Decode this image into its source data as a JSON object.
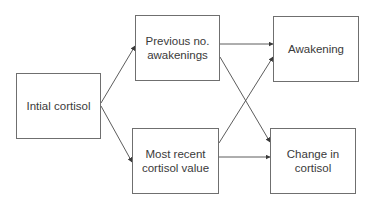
{
  "diagram": {
    "type": "flow-diagram",
    "line_color": "#4a4a4a",
    "nodes": [
      {
        "id": "initial",
        "label": "Intial cortisol",
        "x": 16,
        "y": 73,
        "w": 85,
        "h": 66
      },
      {
        "id": "previous",
        "label": "Previous no.\nawakenings",
        "x": 135,
        "y": 15,
        "w": 85,
        "h": 66
      },
      {
        "id": "recent",
        "label": "Most recent\ncortisol value",
        "x": 132,
        "y": 128,
        "w": 87,
        "h": 66
      },
      {
        "id": "awakening",
        "label": "Awakening",
        "x": 273,
        "y": 16,
        "w": 86,
        "h": 66
      },
      {
        "id": "change",
        "label": "Change in\ncortisol",
        "x": 270,
        "y": 128,
        "w": 86,
        "h": 66
      }
    ],
    "edges": [
      {
        "from": "initial",
        "to": "previous",
        "x1": 101,
        "y1": 103,
        "x2": 135,
        "y2": 46
      },
      {
        "from": "initial",
        "to": "recent",
        "x1": 101,
        "y1": 106,
        "x2": 132,
        "y2": 162
      },
      {
        "from": "previous",
        "to": "awakening",
        "x1": 220,
        "y1": 44,
        "x2": 273,
        "y2": 44
      },
      {
        "from": "previous",
        "to": "change",
        "x1": 220,
        "y1": 57,
        "x2": 270,
        "y2": 142
      },
      {
        "from": "recent",
        "to": "awakening",
        "x1": 219,
        "y1": 143,
        "x2": 273,
        "y2": 57
      },
      {
        "from": "recent",
        "to": "change",
        "x1": 219,
        "y1": 157,
        "x2": 270,
        "y2": 157
      }
    ]
  }
}
